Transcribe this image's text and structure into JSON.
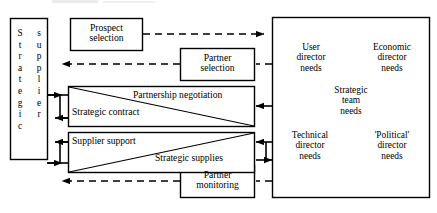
{
  "diagram": {
    "supplier_box": {
      "name": "strategic-supplier",
      "column_1": [
        "S",
        "t",
        "r",
        "a",
        "t",
        "e",
        "g",
        "i",
        "c"
      ],
      "column_2": [
        "s",
        "u",
        "p",
        "p",
        "l",
        "i",
        "e",
        "r"
      ],
      "text": "Strategic supplier"
    },
    "process_boxes": [
      {
        "id": "prospect-selection",
        "line1": "Prospect",
        "line2": "selection",
        "link": "dashed"
      },
      {
        "id": "partner-selection",
        "line1": "Partner",
        "line2": "selection",
        "link": "dashed"
      },
      {
        "id": "partner-monitoring",
        "line1": "Partner",
        "line2": "monitoring",
        "link": "dashed"
      }
    ],
    "split_boxes": [
      {
        "id": "negotiation-contract",
        "upper_label": "Partnership negotiation",
        "lower_label": "Strategic contract",
        "diagonal": "top-left-to-bottom-right"
      },
      {
        "id": "support-supplies",
        "upper_label": "Supplier support",
        "lower_label": "Strategic supplies",
        "diagonal": "bottom-left-to-top-right"
      }
    ],
    "needs_box": {
      "name": "strategic-team-needs",
      "center": [
        "Strategic",
        "team",
        "needs"
      ],
      "quadrants": [
        {
          "id": "user-director-needs",
          "lines": [
            "User",
            "director",
            "needs"
          ]
        },
        {
          "id": "economic-director-needs",
          "lines": [
            "Economic",
            "director",
            "needs"
          ]
        },
        {
          "id": "technical-director-needs",
          "lines": [
            "Technical",
            "director",
            "needs"
          ]
        },
        {
          "id": "political-director-needs",
          "lines": [
            "'Political'",
            "director",
            "needs"
          ]
        }
      ]
    },
    "colors": {
      "line": "#000000",
      "background": "#ffffff"
    }
  }
}
